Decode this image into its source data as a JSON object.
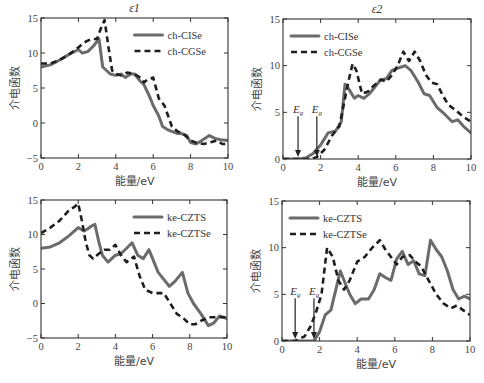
{
  "chart_data": [
    {
      "id": "top-left",
      "type": "line",
      "title": "ε1",
      "xlabel": "能量/eV",
      "ylabel": "介电函数",
      "xlim": [
        0,
        10
      ],
      "ylim": [
        -5,
        15
      ],
      "xticks": [
        0,
        2,
        4,
        6,
        8,
        10
      ],
      "yticks": [
        -5,
        0,
        5,
        10,
        15
      ],
      "grid": false,
      "legend_position": "upper right",
      "box": {
        "left": 41,
        "top": 18,
        "right": 228,
        "bottom": 158
      },
      "series": [
        {
          "name": "ch-CISe",
          "style": "solid",
          "x": [
            0,
            0.5,
            1,
            1.5,
            2,
            2.2,
            2.5,
            2.8,
            3.1,
            3.3,
            3.5,
            3.7,
            4,
            4.3,
            4.5,
            4.8,
            5,
            5.3,
            5.5,
            5.8,
            6,
            6.3,
            6.5,
            6.8,
            7,
            7.3,
            7.5,
            7.8,
            8,
            8.3,
            8.6,
            9,
            9.3,
            9.6,
            10
          ],
          "y": [
            8,
            8.3,
            9,
            9.8,
            10.5,
            10,
            10.2,
            11,
            12,
            8,
            7.5,
            7,
            6.8,
            7,
            6.5,
            7,
            7,
            6,
            5.5,
            3.8,
            2.5,
            1,
            -0.5,
            -1,
            -1.2,
            -1.5,
            -1.5,
            -1.8,
            -2.8,
            -3,
            -2.5,
            -1.8,
            -2.2,
            -2.4,
            -2.5
          ]
        },
        {
          "name": "ch-CGSe",
          "style": "dashed",
          "x": [
            0,
            0.5,
            1,
            1.5,
            2,
            2.3,
            2.7,
            3,
            3.2,
            3.4,
            3.6,
            3.8,
            4,
            4.3,
            4.6,
            5,
            5.3,
            5.5,
            5.7,
            6,
            6.3,
            6.6,
            7,
            7.3,
            7.6,
            8,
            8.3,
            8.7,
            9,
            9.4,
            9.7,
            10
          ],
          "y": [
            8.5,
            8.5,
            9,
            9.8,
            10.8,
            11.5,
            12,
            12,
            13.5,
            14.7,
            11,
            7.5,
            7,
            6.8,
            7.2,
            7,
            6.5,
            5.8,
            6.2,
            6.5,
            3.5,
            2.5,
            -0.5,
            -1.2,
            -1.5,
            -2.5,
            -2.8,
            -3,
            -2.8,
            -2.5,
            -3,
            -3
          ]
        }
      ]
    },
    {
      "id": "top-right",
      "type": "line",
      "title": "ε2",
      "xlabel": "能量/eV",
      "ylabel": "介电函数",
      "xlim": [
        0,
        10
      ],
      "ylim": [
        0,
        15
      ],
      "xticks": [
        0,
        2,
        4,
        6,
        8,
        10
      ],
      "yticks": [
        0,
        5,
        10,
        15
      ],
      "grid": false,
      "legend_position": "upper left",
      "box": {
        "left": 283,
        "top": 19,
        "right": 471,
        "bottom": 159
      },
      "annotations": [
        {
          "text": "Eg",
          "x": 0.8,
          "series": "ch-CISe"
        },
        {
          "text": "Eg",
          "x": 1.8,
          "series": "ch-CGSe"
        }
      ],
      "series": [
        {
          "name": "ch-CISe",
          "style": "solid",
          "x": [
            0,
            0.8,
            1.2,
            1.6,
            2,
            2.4,
            2.8,
            3.1,
            3.3,
            3.5,
            3.8,
            4,
            4.3,
            4.6,
            5,
            5.2,
            5.5,
            5.8,
            6.2,
            6.5,
            6.8,
            7.2,
            7.5,
            7.8,
            8.2,
            8.6,
            9,
            9.3,
            9.6,
            10
          ],
          "y": [
            0,
            0,
            0.1,
            0.6,
            1.5,
            2.8,
            3,
            4,
            8,
            7.5,
            6.5,
            6.8,
            6.5,
            7,
            8,
            8.5,
            8.6,
            9.5,
            9.8,
            10,
            9.5,
            8.2,
            7,
            6.8,
            5.5,
            4.8,
            4,
            4.2,
            3.5,
            2.8
          ]
        },
        {
          "name": "ch-CGSe",
          "style": "dashed",
          "x": [
            0,
            1.5,
            1.8,
            2.2,
            2.6,
            3,
            3.3,
            3.5,
            3.7,
            3.9,
            4.2,
            4.5,
            4.8,
            5.2,
            5.5,
            5.8,
            6.1,
            6.4,
            6.7,
            7,
            7.3,
            7.6,
            7.9,
            8.2,
            8.5,
            8.8,
            9.2,
            9.6,
            10
          ],
          "y": [
            0,
            0,
            0.2,
            1,
            2.5,
            3.5,
            6.5,
            8.5,
            10.2,
            9.5,
            7,
            7.2,
            7.8,
            8.5,
            8.3,
            9,
            10,
            11.5,
            10.5,
            11.5,
            10.5,
            9,
            8.2,
            8,
            6.8,
            5.8,
            5.2,
            4.5,
            4
          ]
        }
      ]
    },
    {
      "id": "bottom-left",
      "type": "line",
      "title": "",
      "xlabel": "能量/eV",
      "ylabel": "介电函数",
      "xlim": [
        0,
        10
      ],
      "ylim": [
        -5,
        15
      ],
      "xticks": [
        0,
        2,
        4,
        6,
        8,
        10
      ],
      "yticks": [
        -5,
        0,
        5,
        10,
        15
      ],
      "grid": false,
      "legend_position": "upper right",
      "box": {
        "left": 41,
        "top": 200,
        "right": 227,
        "bottom": 338
      },
      "series": [
        {
          "name": "ke-CZTS",
          "style": "solid",
          "x": [
            0,
            0.5,
            1,
            1.5,
            2,
            2.3,
            2.5,
            2.7,
            2.9,
            3.1,
            3.3,
            3.6,
            4,
            4.3,
            4.6,
            4.9,
            5.2,
            5.5,
            5.8,
            6,
            6.3,
            6.6,
            6.9,
            7.2,
            7.6,
            7.9,
            8.2,
            8.6,
            9,
            9.3,
            9.6,
            10
          ],
          "y": [
            8,
            8.2,
            8.8,
            9.8,
            11,
            10.5,
            10.8,
            11.2,
            11.5,
            9,
            7,
            6,
            7,
            7.2,
            8,
            8.8,
            7,
            6.5,
            7.8,
            6.5,
            4.5,
            3.5,
            2.5,
            3.2,
            4.5,
            1.5,
            0,
            -1.5,
            -3.2,
            -2.8,
            -1.8,
            -2.2
          ]
        },
        {
          "name": "ke-CZTSe",
          "style": "dashed",
          "x": [
            0,
            0.5,
            1,
            1.5,
            1.8,
            2,
            2.2,
            2.4,
            2.6,
            2.8,
            3.1,
            3.4,
            3.7,
            4,
            4.3,
            4.6,
            5,
            5.3,
            5.6,
            6,
            6.3,
            6.6,
            7,
            7.3,
            7.6,
            8,
            8.3,
            8.6,
            9,
            9.5,
            10
          ],
          "y": [
            10.2,
            11,
            12,
            13.5,
            14,
            14.5,
            12,
            9,
            7,
            6.5,
            7.2,
            7.8,
            7.8,
            8.5,
            7,
            6,
            6.8,
            4,
            2,
            1.5,
            1.5,
            1.5,
            -0.2,
            -1.5,
            -2,
            -3,
            -3,
            -2.5,
            -2,
            -2,
            -2
          ]
        }
      ]
    },
    {
      "id": "bottom-right",
      "type": "line",
      "title": "",
      "xlabel": "能量/eV",
      "ylabel": "介电函数",
      "xlim": [
        0,
        10
      ],
      "ylim": [
        0,
        15
      ],
      "xticks": [
        0,
        2,
        4,
        6,
        8,
        10
      ],
      "yticks": [
        0,
        5,
        10,
        15
      ],
      "grid": false,
      "legend_position": "upper left",
      "box": {
        "left": 282,
        "top": 201,
        "right": 470,
        "bottom": 341
      },
      "annotations": [
        {
          "text": "Eg",
          "x": 0.7,
          "series": "ke-CZTSe"
        },
        {
          "text": "Eg",
          "x": 1.7,
          "series": "ke-CZTS"
        }
      ],
      "series": [
        {
          "name": "ke-CZTS",
          "style": "solid",
          "x": [
            0,
            1.7,
            2,
            2.3,
            2.6,
            2.9,
            3.1,
            3.3,
            3.6,
            3.9,
            4.2,
            4.6,
            4.9,
            5.2,
            5.5,
            5.8,
            6.1,
            6.4,
            6.7,
            7,
            7.3,
            7.6,
            7.9,
            8.2,
            8.5,
            8.8,
            9.1,
            9.4,
            9.7,
            10
          ],
          "y": [
            0,
            0,
            1,
            2.8,
            3.3,
            5.8,
            7.5,
            6.5,
            5,
            4,
            4.5,
            4.5,
            5.5,
            7.2,
            6.8,
            6.5,
            8.8,
            9.6,
            8.2,
            8.6,
            7.2,
            7,
            10.8,
            9.8,
            9,
            7.5,
            5.5,
            4.5,
            4.8,
            4.5
          ]
        },
        {
          "name": "ke-CZTSe",
          "style": "dashed",
          "x": [
            0,
            0.7,
            1.2,
            1.5,
            1.8,
            2.1,
            2.4,
            2.7,
            3,
            3.3,
            3.6,
            4,
            4.4,
            4.8,
            5.2,
            5.5,
            5.8,
            6.1,
            6.4,
            6.8,
            7.1,
            7.4,
            7.8,
            8.2,
            8.6,
            9,
            9.3,
            9.7,
            10
          ],
          "y": [
            0,
            0,
            0.5,
            1.5,
            3,
            5,
            10,
            9,
            6.5,
            5.5,
            6.5,
            8.5,
            9,
            10,
            10.8,
            9.8,
            9,
            8.2,
            9,
            9.2,
            8.5,
            8,
            6.5,
            5,
            4,
            3.5,
            3.8,
            3.2,
            2.8
          ]
        }
      ]
    }
  ],
  "panels": {
    "top_left": {
      "title": "ε1",
      "legend": [
        "ch-CISe",
        "ch-CGSe"
      ],
      "xlabel": "能量/eV",
      "ylabel": "介电函数"
    },
    "top_right": {
      "title": "ε2",
      "legend": [
        "ch-CISe",
        "ch-CGSe"
      ],
      "xlabel": "能量/eV",
      "ylabel": "介电函数",
      "eg_labels": [
        "Eg",
        "Eg"
      ]
    },
    "bottom_left": {
      "legend": [
        "ke-CZTS",
        "ke-CZTSe"
      ],
      "xlabel": "能量/eV",
      "ylabel": "介电函数"
    },
    "bottom_right": {
      "legend": [
        "ke-CZTS",
        "ke-CZTSe"
      ],
      "xlabel": "能量/eV",
      "ylabel": "介电函数",
      "eg_labels": [
        "Eg",
        "Eg"
      ]
    }
  },
  "colors": {
    "solid": "#6b6b6b",
    "dashed": "#1e1e1e",
    "axis": "#333333"
  }
}
